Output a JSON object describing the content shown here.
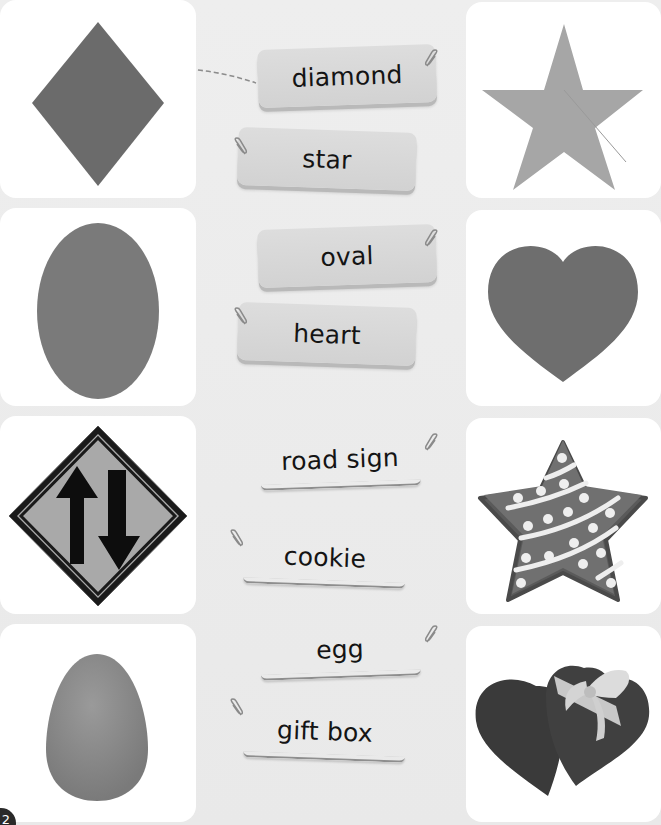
{
  "worksheet": {
    "page_number": "2",
    "rows": [
      {
        "left_image": {
          "name": "diamond-shape",
          "color": "#6b6b6b"
        },
        "right_image": {
          "name": "star-shape",
          "color": "#a6a6a6"
        },
        "labels": [
          {
            "text": "diamond",
            "style": "filled",
            "connected_to": "left"
          },
          {
            "text": "star",
            "style": "filled"
          }
        ]
      },
      {
        "left_image": {
          "name": "oval-shape",
          "color": "#7a7a7a"
        },
        "right_image": {
          "name": "heart-shape",
          "color": "#6e6e6e"
        },
        "labels": [
          {
            "text": "oval",
            "style": "filled"
          },
          {
            "text": "heart",
            "style": "filled"
          }
        ]
      },
      {
        "left_image": {
          "name": "road-sign-two-way-traffic",
          "color": "#a9a9a9"
        },
        "right_image": {
          "name": "star-cookie",
          "color": "#6e6e6e"
        },
        "labels": [
          {
            "text": "road sign",
            "style": "blank"
          },
          {
            "text": "cookie",
            "style": "blank"
          }
        ]
      },
      {
        "left_image": {
          "name": "egg",
          "color": "#8a8a8a"
        },
        "right_image": {
          "name": "heart-gift-box",
          "color": "#404040"
        },
        "labels": [
          {
            "text": "egg",
            "style": "blank"
          },
          {
            "text": "gift box",
            "style": "blank"
          }
        ]
      }
    ],
    "colors": {
      "background": "#ececec",
      "card": "#ffffff",
      "label_fill": "#d6d6d6",
      "text": "#141414",
      "connector": "#8c8c8c"
    }
  }
}
